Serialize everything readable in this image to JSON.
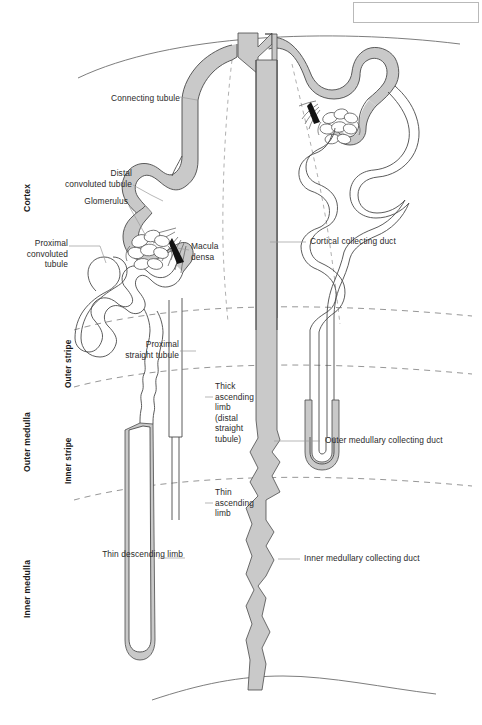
{
  "figure": {
    "kind": "anatomical-line-diagram"
  },
  "zones_vertical": [
    {
      "id": "cortex",
      "label": "Cortex"
    },
    {
      "id": "outer-medulla",
      "label": "Outer medulla"
    },
    {
      "id": "inner-medulla",
      "label": "Inner medulla"
    }
  ],
  "stripes_vertical": [
    {
      "id": "outer-stripe",
      "label": "Outer stripe"
    },
    {
      "id": "inner-stripe",
      "label": "Inner stripe"
    }
  ],
  "labels_left": [
    {
      "id": "connecting-tubule",
      "text": "Connecting tubule"
    },
    {
      "id": "distal-convoluted-tubule",
      "text": "Distal\nconvoluted tubule"
    },
    {
      "id": "glomerulus",
      "text": "Glomerulus"
    },
    {
      "id": "proximal-convoluted-tubule",
      "text": "Proximal\nconvoluted\ntubule"
    },
    {
      "id": "proximal-straight-tubule",
      "text": "Proximal\nstraight tubule"
    },
    {
      "id": "thin-descending-limb",
      "text": "Thin descending limb"
    }
  ],
  "labels_inner": [
    {
      "id": "macula-densa",
      "text": "Macula\ndensa"
    },
    {
      "id": "thick-ascending-limb",
      "text": "Thick\nascending\nlimb\n(distal\nstraight\ntubule)"
    },
    {
      "id": "thin-ascending-limb",
      "text": "Thin\nascending\nlimb"
    }
  ],
  "labels_right": [
    {
      "id": "cortical-collecting-duct",
      "text": "Cortical collecting duct"
    },
    {
      "id": "outer-medullary-collecting-duct",
      "text": "Outer medullary collecting duct"
    },
    {
      "id": "inner-medullary-collecting-duct",
      "text": "Inner medullary collecting duct"
    }
  ],
  "colors": {
    "outline": "#4a4a4a",
    "tubule_fill": "#ffffff",
    "shaded_fill": "#c9c9c9",
    "dashed_boundary": "#8a8a8a",
    "capsule_line": "#6e6e6e",
    "label_text": "#2a2a2a",
    "zone_text": "#1a1a1a",
    "leader_line": "#8a8a8a",
    "macula_densa": "#111111",
    "page_background": "#ffffff"
  }
}
